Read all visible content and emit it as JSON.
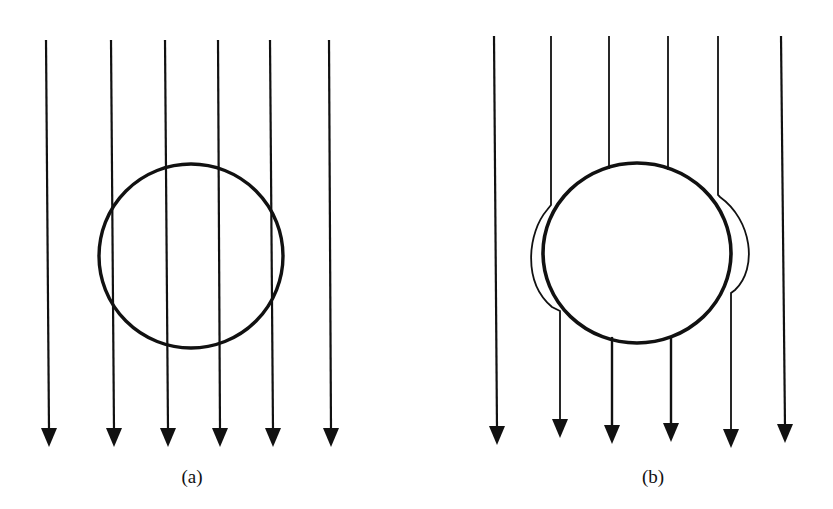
{
  "figure": {
    "stroke_color": "#111111",
    "background": "#ffffff",
    "panels": [
      {
        "id": "a",
        "caption": "(a)",
        "description": "Uniform field lines pass straight through the sphere",
        "circle": {
          "cx": 191,
          "cy": 256,
          "r": 92
        },
        "field_lines": [
          {
            "x_top": 46,
            "x_bottom": 49
          },
          {
            "x_top": 111,
            "x_bottom": 114
          },
          {
            "x_top": 165,
            "x_bottom": 168
          },
          {
            "x_top": 218,
            "x_bottom": 220
          },
          {
            "x_top": 270,
            "x_bottom": 273
          },
          {
            "x_top": 329,
            "x_bottom": 331
          }
        ],
        "line_top_y": 40,
        "arrow_tip_y": 447
      },
      {
        "id": "b",
        "caption": "(b)",
        "description": "Field lines are expelled and bend around the sphere",
        "circle": {
          "cx": 637,
          "cy": 253,
          "rx": 94,
          "ry": 90
        },
        "field_lines": [
          {
            "x_top": 494,
            "x_bottom": 497,
            "tip_y": 445
          },
          {
            "x_top": 551,
            "x_bottom": 560,
            "tip_y": 438,
            "bypass": "left"
          },
          {
            "x_top": 609,
            "x_bottom": 612,
            "tip_y": 444
          },
          {
            "x_top": 668,
            "x_bottom": 671,
            "tip_y": 442
          },
          {
            "x_top": 718,
            "x_bottom": 731,
            "tip_y": 448,
            "bypass": "right"
          },
          {
            "x_top": 781,
            "x_bottom": 785,
            "tip_y": 443
          }
        ],
        "line_top_y": 36
      }
    ]
  }
}
